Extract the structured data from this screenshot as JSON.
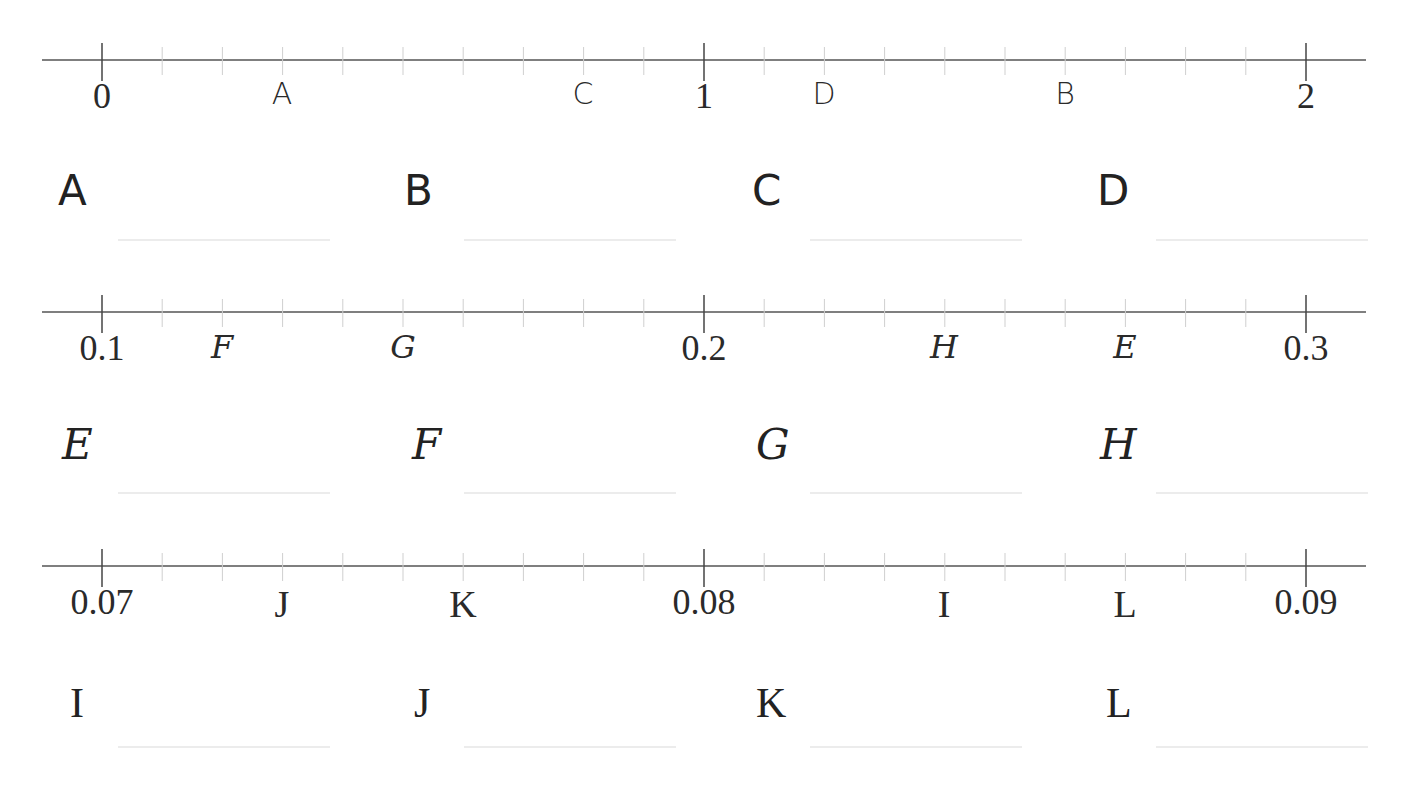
{
  "worksheet": {
    "number_lines": [
      {
        "id": "line-1",
        "y": 60,
        "style": "hand",
        "ticks": {
          "start_x": 102,
          "spacing": 60.2,
          "count": 21,
          "major_every": 10
        },
        "endpoints": [
          {
            "text": "0",
            "x": 102
          },
          {
            "text": "1",
            "x": 704
          },
          {
            "text": "2",
            "x": 1306
          }
        ],
        "points": [
          {
            "letter": "A",
            "x": 282,
            "value": 0.3
          },
          {
            "letter": "C",
            "x": 583,
            "value": 0.8
          },
          {
            "letter": "D",
            "x": 824,
            "value": 1.2
          },
          {
            "letter": "B",
            "x": 1065,
            "value": 1.6
          }
        ]
      },
      {
        "id": "line-2",
        "y": 312,
        "style": "script",
        "ticks": {
          "start_x": 102,
          "spacing": 60.2,
          "count": 21,
          "major_every": 10
        },
        "endpoints": [
          {
            "text": "0.1",
            "x": 102
          },
          {
            "text": "0.2",
            "x": 704
          },
          {
            "text": "0.3",
            "x": 1306
          }
        ],
        "points": [
          {
            "letter": "F",
            "x": 222,
            "value": 0.12
          },
          {
            "letter": "G",
            "x": 403,
            "value": 0.15
          },
          {
            "letter": "H",
            "x": 944,
            "value": 0.24
          },
          {
            "letter": "E",
            "x": 1125,
            "value": 0.27
          }
        ]
      },
      {
        "id": "line-3",
        "y": 566,
        "style": "serif",
        "ticks": {
          "start_x": 102,
          "spacing": 60.2,
          "count": 21,
          "major_every": 10
        },
        "endpoints": [
          {
            "text": "0.07",
            "x": 102
          },
          {
            "text": "0.08",
            "x": 704
          },
          {
            "text": "0.09",
            "x": 1306
          }
        ],
        "points": [
          {
            "letter": "J",
            "x": 282,
            "value": 0.073
          },
          {
            "letter": "K",
            "x": 463,
            "value": 0.076
          },
          {
            "letter": "I",
            "x": 944,
            "value": 0.084
          },
          {
            "letter": "L",
            "x": 1125,
            "value": 0.087
          }
        ]
      }
    ],
    "answer_rows": [
      {
        "style": "hand",
        "label_y": 170,
        "line_y": 239,
        "items": [
          {
            "letter": "A",
            "x": 58
          },
          {
            "letter": "B",
            "x": 404
          },
          {
            "letter": "C",
            "x": 752
          },
          {
            "letter": "D",
            "x": 1097
          }
        ]
      },
      {
        "style": "script",
        "label_y": 424,
        "line_y": 492,
        "items": [
          {
            "letter": "E",
            "x": 62
          },
          {
            "letter": "F",
            "x": 412
          },
          {
            "letter": "G",
            "x": 756
          },
          {
            "letter": "H",
            "x": 1100
          }
        ]
      },
      {
        "style": "serif",
        "label_y": 682,
        "line_y": 746,
        "items": [
          {
            "letter": "I",
            "x": 70
          },
          {
            "letter": "J",
            "x": 414
          },
          {
            "letter": "K",
            "x": 756
          },
          {
            "letter": "L",
            "x": 1106
          }
        ]
      }
    ]
  }
}
